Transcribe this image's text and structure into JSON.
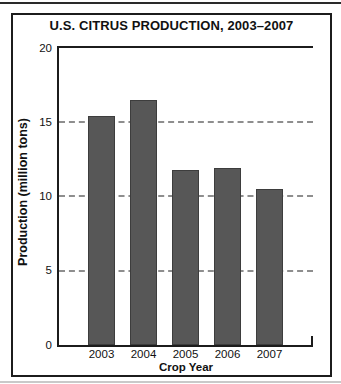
{
  "chart_data": {
    "type": "bar",
    "title": "U.S. CITRUS PRODUCTION, 2003–2007",
    "xlabel": "Crop Year",
    "ylabel": "Production (million tons)",
    "categories": [
      "2003",
      "2004",
      "2005",
      "2006",
      "2007"
    ],
    "values": [
      15.4,
      16.5,
      11.8,
      11.9,
      10.5
    ],
    "ylim": [
      0,
      20
    ],
    "yticks": [
      0,
      5,
      10,
      15,
      20
    ],
    "gridline_values": [
      5,
      10,
      15
    ],
    "grid": "horizontal-dashed",
    "legend": "none",
    "bar_color": "#575757",
    "axis_color": "#1c1c1c",
    "gridline_color": "#8e8e8e"
  }
}
